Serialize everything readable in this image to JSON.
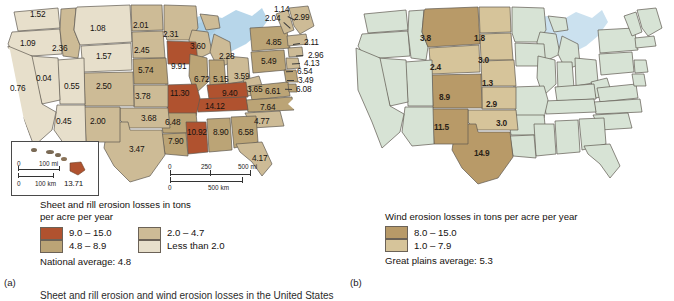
{
  "figure": {
    "caption": "Sheet and rill erosion and wind erosion losses in the United States",
    "panel_a_letter": "(a)",
    "panel_b_letter": "(b)"
  },
  "colors": {
    "class_9_15": "#b0522f",
    "class_48_89": "#bba476",
    "class_20_47": "#cdbb96",
    "class_lt20": "#e7dfcb",
    "wind_8_15": "#b89a68",
    "wind_1_79": "#d6c49a",
    "wind_base": "#d7e3d5",
    "water": "#aacfe6",
    "outline": "#5e5950"
  },
  "map_a": {
    "legend": {
      "title": "Sheet and rill erosion losses in tons\nper acre per year",
      "classes": [
        {
          "label": "9.0 – 15.0",
          "color_key": "class_9_15"
        },
        {
          "label": "2.0 – 4.7",
          "color_key": "class_20_47"
        },
        {
          "label": "4.8 – 8.9",
          "color_key": "class_48_89"
        },
        {
          "label": "Less than 2.0",
          "color_key": "class_lt20"
        }
      ],
      "average": "National average:  4.8"
    },
    "scalebar": {
      "mi_0": "0",
      "mi_250": "250",
      "mi_500": "500 mi",
      "km_0": "0",
      "km_500": "500 km"
    },
    "inset": {
      "mi_0": "0",
      "mi_100": "100 mi",
      "km_0": "0",
      "km_100": "100 km",
      "hawaii_value": "13.71"
    },
    "values": [
      {
        "state": "WA",
        "value": "1.52",
        "x": 35,
        "y": 14,
        "cls": "class_lt20"
      },
      {
        "state": "OR",
        "value": "1.09",
        "x": 25,
        "y": 43,
        "cls": "class_lt20"
      },
      {
        "state": "ID",
        "value": "2.36",
        "x": 54,
        "y": 47,
        "cls": "class_20_47"
      },
      {
        "state": "MT",
        "value": "1.08",
        "x": 85,
        "y": 28,
        "cls": "class_lt20"
      },
      {
        "state": "ND",
        "value": "2.01",
        "x": 131,
        "y": 26,
        "cls": "class_20_47"
      },
      {
        "state": "MN",
        "value": "2.31",
        "x": 166,
        "y": 33,
        "cls": "class_20_47"
      },
      {
        "state": "WI",
        "value": "3.60",
        "x": 194,
        "y": 44,
        "cls": "class_20_47"
      },
      {
        "state": "MI",
        "value": "2.28",
        "x": 222,
        "y": 55,
        "cls": "class_20_47"
      },
      {
        "state": "WY",
        "value": "1.57",
        "x": 97,
        "y": 55,
        "cls": "class_lt20"
      },
      {
        "state": "SD",
        "value": "2.45",
        "x": 134,
        "y": 49,
        "cls": "class_20_47"
      },
      {
        "state": "NE",
        "value": "5.74",
        "x": 138,
        "y": 70,
        "cls": "class_48_89"
      },
      {
        "state": "IA",
        "value": "9.91",
        "x": 172,
        "y": 65,
        "cls": "class_9_15"
      },
      {
        "state": "IL",
        "value": "6.72",
        "x": 196,
        "y": 77,
        "cls": "class_48_89"
      },
      {
        "state": "IN",
        "value": "5.15",
        "x": 214,
        "y": 77,
        "cls": "class_48_89"
      },
      {
        "state": "OH",
        "value": "3.59",
        "x": 236,
        "y": 74,
        "cls": "class_20_47"
      },
      {
        "state": "PA",
        "value": "5.49",
        "x": 263,
        "y": 60,
        "cls": "class_48_89"
      },
      {
        "state": "NY",
        "value": "4.85",
        "x": 268,
        "y": 41,
        "cls": "class_48_89"
      },
      {
        "state": "WV",
        "value": "3.65",
        "x": 249,
        "y": 87,
        "cls": "class_20_47"
      },
      {
        "state": "VA",
        "value": "6.61",
        "x": 267,
        "y": 90,
        "cls": "class_48_89"
      },
      {
        "state": "NC",
        "value": "7.64",
        "x": 262,
        "y": 105,
        "cls": "class_48_89"
      },
      {
        "state": "SC",
        "value": "4.77",
        "x": 256,
        "y": 119,
        "cls": "class_20_47"
      },
      {
        "state": "KY",
        "value": "9.40",
        "x": 224,
        "y": 92,
        "cls": "class_9_15"
      },
      {
        "state": "TN",
        "value": "14.12",
        "x": 208,
        "y": 105,
        "cls": "class_9_15"
      },
      {
        "state": "MO",
        "value": "11.30",
        "x": 173,
        "y": 92,
        "cls": "class_9_15"
      },
      {
        "state": "AR",
        "value": "6.48",
        "x": 167,
        "y": 120,
        "cls": "class_48_89"
      },
      {
        "state": "MS",
        "value": "10.92",
        "x": 190,
        "y": 131,
        "cls": "class_9_15"
      },
      {
        "state": "AL",
        "value": "8.90",
        "x": 215,
        "y": 131,
        "cls": "class_48_89"
      },
      {
        "state": "GA",
        "value": "6.58",
        "x": 240,
        "y": 131,
        "cls": "class_48_89"
      },
      {
        "state": "LA",
        "value": "7.90",
        "x": 170,
        "y": 139,
        "cls": "class_48_89"
      },
      {
        "state": "FL",
        "value": "4.17",
        "x": 254,
        "y": 156,
        "cls": "class_20_47"
      },
      {
        "state": "KS",
        "value": "3.78",
        "x": 137,
        "y": 95,
        "cls": "class_20_47"
      },
      {
        "state": "OK",
        "value": "3.68",
        "x": 143,
        "y": 117,
        "cls": "class_20_47"
      },
      {
        "state": "TX",
        "value": "3.47",
        "x": 131,
        "y": 148,
        "cls": "class_20_47"
      },
      {
        "state": "CO",
        "value": "2.50",
        "x": 98,
        "y": 85,
        "cls": "class_20_47"
      },
      {
        "state": "NM",
        "value": "2.00",
        "x": 92,
        "y": 120,
        "cls": "class_20_47"
      },
      {
        "state": "UT",
        "value": "0.55",
        "x": 66,
        "y": 85,
        "cls": "class_lt20"
      },
      {
        "state": "AZ",
        "value": "0.45",
        "x": 58,
        "y": 120,
        "cls": "class_lt20"
      },
      {
        "state": "NV",
        "value": "0.04",
        "x": 38,
        "y": 77,
        "cls": "class_lt20"
      },
      {
        "state": "CA",
        "value": "0.76",
        "x": 12,
        "y": 86,
        "cls": "class_lt20"
      },
      {
        "state": "VT",
        "value": "1.14",
        "x": 277,
        "y": 9,
        "cls": "class_lt20"
      },
      {
        "state": "NH",
        "value": "2.04",
        "x": 269,
        "y": 18,
        "cls": "class_20_47"
      },
      {
        "state": "ME",
        "value": "2.99",
        "x": 296,
        "y": 17,
        "cls": "class_20_47"
      },
      {
        "state": "MA",
        "value": "2.11",
        "x": 306,
        "y": 41,
        "cls": "class_20_47"
      },
      {
        "state": "RI",
        "value": "2.96",
        "x": 310,
        "y": 54,
        "cls": "class_20_47"
      },
      {
        "state": "CT",
        "value": "4.13",
        "x": 306,
        "y": 62,
        "cls": "class_20_47"
      },
      {
        "state": "NJ",
        "value": "6.54",
        "x": 299,
        "y": 70,
        "cls": "class_48_89"
      },
      {
        "state": "DE",
        "value": "3.49",
        "x": 300,
        "y": 79,
        "cls": "class_20_47"
      },
      {
        "state": "MD",
        "value": "6.08",
        "x": 298,
        "y": 88,
        "cls": "class_48_89"
      }
    ]
  },
  "map_b": {
    "legend": {
      "title": "Wind erosion losses in tons per acre per year",
      "classes": [
        {
          "label": "8.0 – 15.0",
          "color_key": "wind_8_15"
        },
        {
          "label": "1.0 – 7.9",
          "color_key": "wind_1_79"
        }
      ],
      "average": "Great plains average:  5.3"
    },
    "values": [
      {
        "state": "MT",
        "value": "3.8",
        "x": 84,
        "y": 37,
        "cls": "wind_1_79"
      },
      {
        "state": "ND",
        "value": "1.8",
        "x": 136,
        "y": 37,
        "cls": "wind_1_79"
      },
      {
        "state": "SD",
        "value": "3.0",
        "x": 140,
        "y": 59,
        "cls": "wind_1_79"
      },
      {
        "state": "WY",
        "value": "2.4",
        "x": 93,
        "y": 66,
        "cls": "wind_1_79"
      },
      {
        "state": "NE",
        "value": "1.3",
        "x": 144,
        "y": 82,
        "cls": "wind_1_79"
      },
      {
        "state": "CO",
        "value": "8.9",
        "x": 102,
        "y": 96,
        "cls": "wind_8_15"
      },
      {
        "state": "KS",
        "value": "2.9",
        "x": 148,
        "y": 103,
        "cls": "wind_1_79"
      },
      {
        "state": "OK",
        "value": "3.0",
        "x": 158,
        "y": 122,
        "cls": "wind_1_79"
      },
      {
        "state": "NM",
        "value": "11.5",
        "x": 97,
        "y": 126,
        "cls": "wind_8_15"
      },
      {
        "state": "TX",
        "value": "14.9",
        "x": 137,
        "y": 152,
        "cls": "wind_8_15"
      }
    ]
  }
}
